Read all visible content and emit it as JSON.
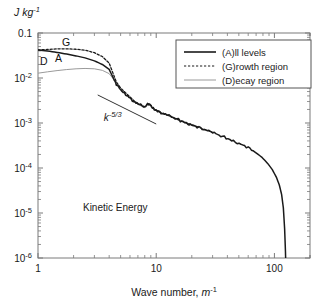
{
  "figure": {
    "background_color": "#ffffff",
    "frame_color": "#7a7a7a",
    "text_color": "#1a1a1a"
  },
  "axes": {
    "y_axis_label": "J kg",
    "y_axis_label_exponent": "-1",
    "x_axis_label_prefix": "Wave number, ",
    "x_axis_label_unit": "m",
    "x_axis_label_exponent": "-1",
    "x_ticks": [
      "1",
      "10",
      "100"
    ],
    "y_ticks": [
      {
        "mantissa": "0.1",
        "base": "",
        "exp": ""
      },
      {
        "mantissa": "",
        "base": "10",
        "exp": "-2"
      },
      {
        "mantissa": "",
        "base": "10",
        "exp": "-3"
      },
      {
        "mantissa": "",
        "base": "10",
        "exp": "-4"
      },
      {
        "mantissa": "",
        "base": "10",
        "exp": "-5"
      },
      {
        "mantissa": "",
        "base": "10",
        "exp": "-6"
      }
    ]
  },
  "annotations": {
    "inner_title": "Kinetic Energy",
    "slope_label_base": "k",
    "slope_label_exp": "-5/3",
    "curve_marks": [
      {
        "label": "G",
        "x": 62,
        "y": 46
      },
      {
        "label": "A",
        "x": 55,
        "y": 62
      },
      {
        "label": "D",
        "x": 40,
        "y": 65
      }
    ]
  },
  "legend": {
    "position": "top-right",
    "items": [
      {
        "label": "(A)ll levels",
        "style": "solid",
        "color": "#1a1a1a",
        "width": 1.6
      },
      {
        "label": "(G)rowth region",
        "style": "dotted",
        "color": "#1a1a1a",
        "width": 1.2
      },
      {
        "label": "(D)ecay region",
        "style": "solid",
        "color": "#9a9a9a",
        "width": 1.0
      }
    ]
  },
  "chart_data": {
    "type": "line",
    "title": "Kinetic Energy",
    "xlabel": "Wave number, m^-1",
    "ylabel": "J kg^-1",
    "xscale": "log",
    "yscale": "log",
    "xlim": [
      1,
      200
    ],
    "ylim": [
      1e-06,
      0.1
    ],
    "grid": false,
    "legend_position": "top-right",
    "annotations": [
      {
        "text": "k^-5/3",
        "type": "slope-reference-line",
        "x_range": [
          3.2,
          10.0
        ],
        "y_range": [
          0.0042,
          0.00095
        ]
      },
      {
        "text": "Kinetic Energy",
        "type": "inner-label",
        "x": 4.5,
        "y": 1.1e-05
      },
      {
        "text": "G",
        "type": "curve-tag"
      },
      {
        "text": "A",
        "type": "curve-tag"
      },
      {
        "text": "D",
        "type": "curve-tag"
      }
    ],
    "series": [
      {
        "name": "(A)ll levels",
        "style": "solid",
        "color": "#1a1a1a",
        "x": [
          1.0,
          1.2,
          1.45,
          1.75,
          2.1,
          2.5,
          3.0,
          3.5,
          4.0,
          4.3,
          4.6,
          5.0,
          5.5,
          6.0,
          6.6,
          7.2,
          8.0,
          8.6,
          9.0,
          9.6,
          10.5,
          11.5,
          12.5,
          14,
          16,
          18,
          20,
          23,
          26,
          30,
          34,
          39,
          45,
          52,
          60,
          68,
          78,
          88,
          96,
          104,
          110,
          115,
          119,
          122,
          124,
          125
        ],
        "y": [
          0.042,
          0.04,
          0.037,
          0.034,
          0.031,
          0.028,
          0.024,
          0.02,
          0.0155,
          0.0105,
          0.0072,
          0.0055,
          0.0044,
          0.0036,
          0.0029,
          0.00255,
          0.00225,
          0.00268,
          0.00245,
          0.00205,
          0.00178,
          0.0016,
          0.00148,
          0.00131,
          0.00113,
          0.001,
          0.00091,
          0.00079,
          0.0007,
          0.00061,
          0.00054,
          0.00047,
          0.0004,
          0.00034,
          0.00028,
          0.00023,
          0.000175,
          0.000125,
          9.2e-05,
          6.2e-05,
          4.2e-05,
          2.6e-05,
          1.3e-05,
          4.5e-06,
          1.4e-06,
          6e-07
        ]
      },
      {
        "name": "(G)rowth region",
        "style": "dotted",
        "color": "#1a1a1a",
        "x": [
          1.0,
          1.2,
          1.45,
          1.75,
          2.1,
          2.5,
          3.0,
          3.5,
          4.0,
          4.3,
          4.6,
          5.0,
          5.5,
          6.0,
          6.6,
          7.2,
          8.0,
          8.6,
          9.0,
          9.6,
          10.5,
          11.5,
          12.5,
          14,
          16,
          18,
          20,
          23,
          26,
          30
        ],
        "y": [
          0.042,
          0.043,
          0.0445,
          0.0445,
          0.0435,
          0.0415,
          0.0365,
          0.03,
          0.0215,
          0.013,
          0.0082,
          0.006,
          0.0047,
          0.0038,
          0.003,
          0.00262,
          0.0023,
          0.00272,
          0.00248,
          0.00208,
          0.0018,
          0.00162,
          0.0015,
          0.00132,
          0.00114,
          0.00101,
          0.00092,
          0.0008,
          0.00071,
          0.00062
        ]
      },
      {
        "name": "(D)ecay region",
        "style": "solid",
        "color": "#9a9a9a",
        "x": [
          1.0,
          1.2,
          1.45,
          1.75,
          2.1,
          2.5,
          3.0,
          3.5,
          4.0,
          4.3,
          4.6,
          5.0,
          5.5,
          6.0,
          6.6,
          7.2,
          8.0,
          8.6,
          9.0,
          9.6,
          10.5,
          11.5,
          12.5,
          14,
          16,
          18,
          20
        ],
        "y": [
          0.0128,
          0.0137,
          0.0146,
          0.0154,
          0.016,
          0.0163,
          0.016,
          0.0148,
          0.0125,
          0.0098,
          0.007,
          0.0054,
          0.0043,
          0.0035,
          0.00285,
          0.0025,
          0.0022,
          0.00262,
          0.0024,
          0.00202,
          0.00175,
          0.00158,
          0.00146,
          0.00129,
          0.00111,
          0.00099,
          0.0009
        ]
      }
    ]
  }
}
